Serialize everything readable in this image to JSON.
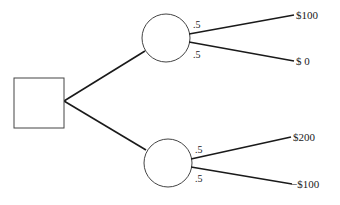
{
  "diagram": {
    "type": "decision-tree",
    "decision_node": {
      "shape": "square"
    },
    "chance_nodes": [
      {
        "id": "upper",
        "branches": [
          {
            "probability": ".5",
            "payoff": "$100"
          },
          {
            "probability": ".5",
            "payoff": "$ 0"
          }
        ]
      },
      {
        "id": "lower",
        "branches": [
          {
            "probability": ".5",
            "payoff": "$200"
          },
          {
            "probability": ".5",
            "payoff": "−$100"
          }
        ]
      }
    ]
  }
}
